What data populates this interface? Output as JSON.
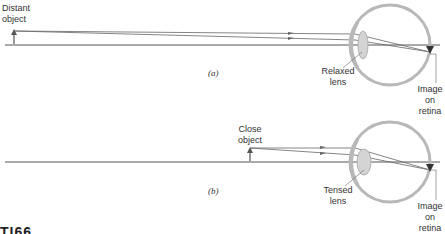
{
  "panel_a": {
    "caption": "(a)",
    "object_label": "Distant\nobject",
    "lens_label": "Relaxed\nlens",
    "image_label": "Image\non\nretina"
  },
  "panel_b": {
    "caption": "(b)",
    "object_label": "Close\nobject",
    "lens_label": "Tensed\nlens",
    "image_label": "Image\non\nretina"
  },
  "figure_fragment": "TI66",
  "colors": {
    "line": "#555555",
    "eye": "#b8b8b8",
    "lens": "#c8c8c8",
    "text": "#333333"
  }
}
